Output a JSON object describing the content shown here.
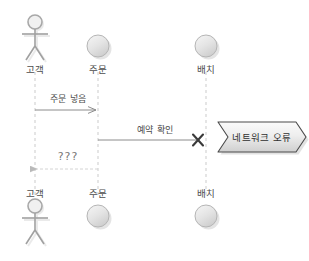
{
  "diagram": {
    "type": "uml-sequence-diagram",
    "width": 309,
    "height": 261,
    "background_color": "#ffffff"
  },
  "lifelines": [
    {
      "id": "customer",
      "label_top": "고객",
      "label_bottom": "고객",
      "icon": "actor-stick-figure-icon",
      "x": 35
    },
    {
      "id": "order",
      "label_top": "주문",
      "label_bottom": "주문",
      "icon": "object-sphere-icon",
      "x": 98
    },
    {
      "id": "batch",
      "label_top": "배치",
      "label_bottom": "배치",
      "icon": "object-sphere-icon",
      "x": 206
    }
  ],
  "messages": [
    {
      "id": "place-order",
      "label": "주문 넣음",
      "from": "customer",
      "to": "order",
      "style": "solid",
      "direction": "right",
      "y": 110,
      "label_x": 68,
      "label_y": 95
    },
    {
      "id": "confirm-reservation",
      "label": "예약 확인",
      "from": "order",
      "to": "batch",
      "style": "solid",
      "direction": "right",
      "terminator": "x-mark",
      "y": 140,
      "label_x": 155,
      "label_y": 126
    },
    {
      "id": "unknown-return",
      "label": "???",
      "from": "order",
      "to": "customer",
      "style": "dashed",
      "direction": "left",
      "y": 169,
      "label_x": 68,
      "label_y": 153
    }
  ],
  "note": {
    "id": "network-error-callout",
    "label": "네트워크 오류",
    "shape": "chevron-arrow",
    "x": 256,
    "y": 137,
    "fill_start": "#f2f2f2",
    "fill_end": "#d2d2d2",
    "border_color": "#4a4a4a"
  },
  "colors": {
    "lifeline": "#c9c9c9",
    "message_solid": "#8c8c8c",
    "message_dashed": "#d0d0d0",
    "x_mark": "#3a3a3a",
    "actor": "#9a9a9a",
    "object_fill": "#ededed",
    "object_stroke": "#b5b5b5",
    "text": "#4d4d4d"
  }
}
